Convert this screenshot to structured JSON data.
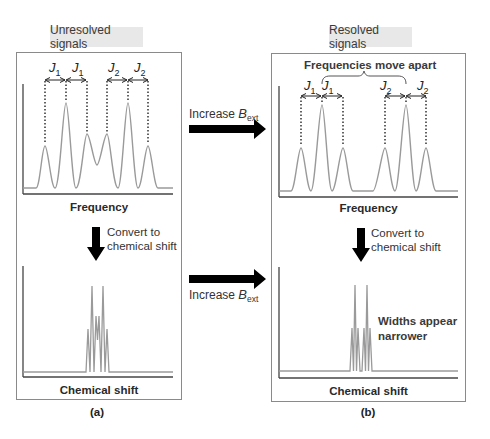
{
  "panels": {
    "a": {
      "tag": "Unresolved signals",
      "top_axis_label": "Frequency",
      "convert_note_line1": "Convert to",
      "convert_note_line2": "chemical shift",
      "bottom_axis_label": "Chemical shift",
      "caption": "(a)",
      "coupling_labels": [
        {
          "symbol": "J",
          "sub": "1"
        },
        {
          "symbol": "J",
          "sub": "1"
        },
        {
          "symbol": "J",
          "sub": "2"
        },
        {
          "symbol": "J",
          "sub": "2"
        }
      ]
    },
    "b": {
      "tag": "Resolved signals",
      "brace_label": "Frequencies move apart",
      "top_axis_label": "Frequency",
      "convert_note_line1": "Convert to",
      "convert_note_line2": "chemical shift",
      "bottom_axis_label": "Chemical shift",
      "width_note_line1": "Widths appear",
      "width_note_line2": "narrower",
      "caption": "(b)",
      "coupling_labels": [
        {
          "symbol": "J",
          "sub": "1"
        },
        {
          "symbol": "J",
          "sub": "1"
        },
        {
          "symbol": "J",
          "sub": "2"
        },
        {
          "symbol": "J",
          "sub": "2"
        }
      ]
    }
  },
  "middle_arrows": {
    "top": {
      "text": "Increase ",
      "symbol": "B",
      "sub": "ext"
    },
    "bottom": {
      "text": "Increase ",
      "symbol": "B",
      "sub": "ext"
    }
  },
  "colors": {
    "spectrum_line": "#9a9a9a",
    "axis": "#444444",
    "arrow": "#000000",
    "tag_bg": "#e8e8e8",
    "panel_border": "#8a8a8a"
  }
}
